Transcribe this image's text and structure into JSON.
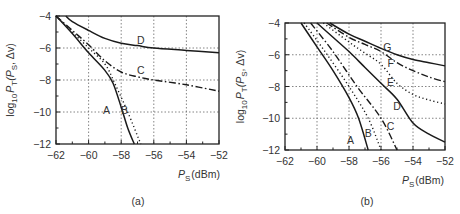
{
  "chart_data": [
    {
      "type": "line",
      "panel_label": "(a)",
      "xlabel": "P_S (dBm)",
      "ylabel": "log10 P_T(P_S, Δv)",
      "xlim": [
        -62,
        -52
      ],
      "ylim": [
        -12,
        -4
      ],
      "xticks": [
        -62,
        -60,
        -58,
        -56,
        -54,
        -52
      ],
      "yticks": [
        -4,
        -6,
        -8,
        -10,
        -12
      ],
      "grid": true,
      "series": [
        {
          "name": "A",
          "style": "solid",
          "x": [
            -62,
            -61,
            -60,
            -59,
            -58.5,
            -58,
            -57.6,
            -57.2
          ],
          "y": [
            -4,
            -5.1,
            -6.3,
            -7.4,
            -8.2,
            -9.7,
            -11,
            -12
          ]
        },
        {
          "name": "B",
          "style": "dotted",
          "x": [
            -62,
            -61,
            -60,
            -59,
            -58.4,
            -57.6,
            -56.8
          ],
          "y": [
            -4,
            -5.0,
            -6.0,
            -7.0,
            -8.2,
            -10,
            -12
          ]
        },
        {
          "name": "C",
          "style": "dashdot",
          "x": [
            -62,
            -61,
            -60,
            -59,
            -58,
            -57,
            -56,
            -54,
            -52
          ],
          "y": [
            -4,
            -4.9,
            -5.8,
            -6.8,
            -7.5,
            -7.8,
            -8.0,
            -8.3,
            -8.7
          ]
        },
        {
          "name": "D",
          "style": "solid",
          "x": [
            -61.4,
            -61,
            -60,
            -59,
            -58,
            -57,
            -56,
            -54,
            -52
          ],
          "y": [
            -4,
            -4.35,
            -4.9,
            -5.4,
            -5.7,
            -5.85,
            -6.0,
            -6.15,
            -6.3
          ]
        }
      ]
    },
    {
      "type": "line",
      "panel_label": "(b)",
      "xlabel": "P_S (dBm)",
      "ylabel": "log10 P_T(P_S, Δv)",
      "xlim": [
        -62,
        -52
      ],
      "ylim": [
        -12,
        -4
      ],
      "xticks": [
        -62,
        -60,
        -58,
        -56,
        -54,
        -52
      ],
      "yticks": [
        -4,
        -6,
        -8,
        -10,
        -12
      ],
      "grid": true,
      "series": [
        {
          "name": "A",
          "style": "solid",
          "x": [
            -61,
            -60,
            -59,
            -58,
            -57.4,
            -56.8
          ],
          "y": [
            -4,
            -5.5,
            -7.0,
            -8.7,
            -10,
            -12
          ]
        },
        {
          "name": "B",
          "style": "dotted",
          "x": [
            -60.8,
            -59.5,
            -58,
            -56.8,
            -56
          ],
          "y": [
            -4,
            -5.8,
            -8.0,
            -10,
            -12
          ]
        },
        {
          "name": "C",
          "style": "dashdot",
          "x": [
            -60.4,
            -59,
            -57.5,
            -56,
            -55
          ],
          "y": [
            -4,
            -5.8,
            -8.0,
            -10,
            -12
          ]
        },
        {
          "name": "D",
          "style": "solid",
          "x": [
            -60,
            -59,
            -58,
            -57,
            -56,
            -55,
            -54,
            -53,
            -52
          ],
          "y": [
            -4,
            -4.9,
            -5.8,
            -6.8,
            -7.8,
            -8.8,
            -10.3,
            -11.0,
            -11.5
          ]
        },
        {
          "name": "E",
          "style": "dotted",
          "x": [
            -59.6,
            -58,
            -57,
            -56,
            -55,
            -54,
            -53,
            -52
          ],
          "y": [
            -4,
            -5.2,
            -5.9,
            -6.6,
            -7.8,
            -8.5,
            -8.85,
            -9.1
          ]
        },
        {
          "name": "F",
          "style": "dashdot",
          "x": [
            -59.4,
            -58,
            -57,
            -56,
            -55,
            -54,
            -53,
            -52
          ],
          "y": [
            -4,
            -4.9,
            -5.35,
            -5.8,
            -6.5,
            -7.0,
            -7.4,
            -7.7
          ]
        },
        {
          "name": "G",
          "style": "solid",
          "x": [
            -59.2,
            -58,
            -57,
            -56,
            -55,
            -54,
            -53,
            -52
          ],
          "y": [
            -4,
            -4.7,
            -5.15,
            -5.6,
            -6.0,
            -6.3,
            -6.5,
            -6.7
          ]
        }
      ]
    }
  ],
  "labels": {
    "panel_a": "(a)",
    "panel_b": "(b)",
    "xlabel_main": "P",
    "xlabel_sub": "S",
    "xlabel_unit": "(dBm)",
    "ylabel_log": "log",
    "ylabel_logsub": "10",
    "ylabel_P": "P",
    "ylabel_Psub": "T",
    "ylabel_args": "(P",
    "ylabel_args_sub": "S",
    "ylabel_args_tail": ", Δv)"
  }
}
